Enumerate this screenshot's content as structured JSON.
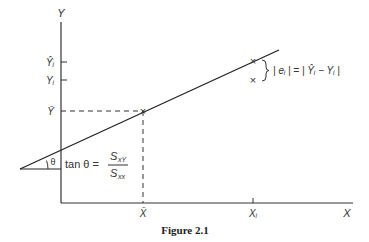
{
  "figure": {
    "caption": "Figure 2.1",
    "axes": {
      "x_label": "X",
      "y_label": "Y",
      "x_ticks": [
        "X̄",
        "Xᵢ"
      ],
      "y_ticks": [
        "Ŷᵢ",
        "Yᵢ",
        "Ȳ"
      ]
    },
    "annotations": {
      "slope_prefix": "tan θ =",
      "slope_numerator": "S",
      "slope_numerator_sub": "xY",
      "slope_denominator": "S",
      "slope_denominator_sub": "xx",
      "angle": "θ",
      "residual": "| eᵢ | = | Ŷᵢ − Yᵢ |"
    },
    "markers": {
      "mean_point": "×",
      "fitted_point": "×",
      "observed_point": "×"
    },
    "colors": {
      "ink": "#333333",
      "background": "#ffffff"
    }
  }
}
